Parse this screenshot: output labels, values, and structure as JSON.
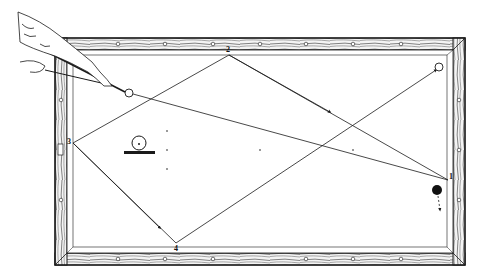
{
  "diagram": {
    "colors": {
      "ink": "#1a1a1a",
      "paper": "#ffffff",
      "rail_fill": "#f4f4f4"
    },
    "cushion_labels": [
      {
        "id": "1",
        "text": "1",
        "x": 449,
        "y": 176
      },
      {
        "id": "2",
        "text": "2",
        "x": 227,
        "y": 48
      },
      {
        "id": "3",
        "text": "3",
        "x": 68,
        "y": 141
      },
      {
        "id": "4",
        "text": "4",
        "x": 176,
        "y": 244
      }
    ],
    "balls": {
      "cue_ball": {
        "x": 129,
        "y": 93,
        "r": 4,
        "style": "open"
      },
      "object_ball_top_right": {
        "x": 439,
        "y": 67,
        "r": 4,
        "style": "open"
      },
      "object_ball_black": {
        "x": 437,
        "y": 190,
        "r": 5,
        "style": "solid"
      },
      "spotted_ball": {
        "x": 139,
        "y": 143,
        "r": 7,
        "style": "open-with-dot"
      }
    },
    "path_points": [
      {
        "name": "cue",
        "x": 129,
        "y": 93
      },
      {
        "name": "cushion-1",
        "x": 448,
        "y": 180
      },
      {
        "name": "cushion-2",
        "x": 229,
        "y": 55
      },
      {
        "name": "cushion-3",
        "x": 73,
        "y": 143
      },
      {
        "name": "cushion-4",
        "x": 176,
        "y": 243
      }
    ]
  }
}
